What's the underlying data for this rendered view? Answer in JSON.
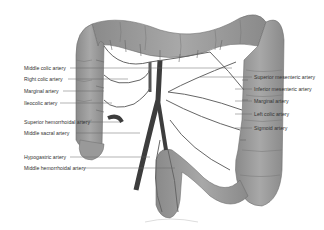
{
  "diagram": {
    "colors": {
      "colon": "#9a9a9a",
      "colon_dark": "#7f7f7f",
      "artery": "#5a5a5a",
      "artery_dark": "#3a3a3a",
      "line": "#666666"
    },
    "left_labels": [
      {
        "text": "Middle colic artery",
        "x": 24,
        "y": 66,
        "line_to": 232
      },
      {
        "text": "Right colic artery",
        "x": 24,
        "y": 77,
        "line_to": 128
      },
      {
        "text": "Marginal artery",
        "x": 24,
        "y": 89,
        "line_to": 103
      },
      {
        "text": "Ileocolic artery",
        "x": 24,
        "y": 101,
        "line_to": 112
      },
      {
        "text": "Superior hemorrhoidal artery",
        "x": 24,
        "y": 120,
        "line_to": 120
      },
      {
        "text": "Middle sacral artery",
        "x": 24,
        "y": 131,
        "line_to": 140
      },
      {
        "text": "Hypogastric artery",
        "x": 24,
        "y": 155,
        "line_to": 150
      },
      {
        "text": "Middle hemorrhoidal artery",
        "x": 24,
        "y": 166,
        "line_to": 175
      }
    ],
    "right_labels": [
      {
        "text": "Superior mesenteric artery",
        "x": 254,
        "y": 75,
        "line_from": 200
      },
      {
        "text": "Inferior mesenteric artery",
        "x": 254,
        "y": 87,
        "line_from": 235
      },
      {
        "text": "Marginal artery",
        "x": 254,
        "y": 99,
        "line_from": 235
      },
      {
        "text": "Left colic artery",
        "x": 254,
        "y": 112,
        "line_from": 235
      },
      {
        "text": "Sigmoid artery",
        "x": 254,
        "y": 126,
        "line_from": 235
      }
    ]
  }
}
